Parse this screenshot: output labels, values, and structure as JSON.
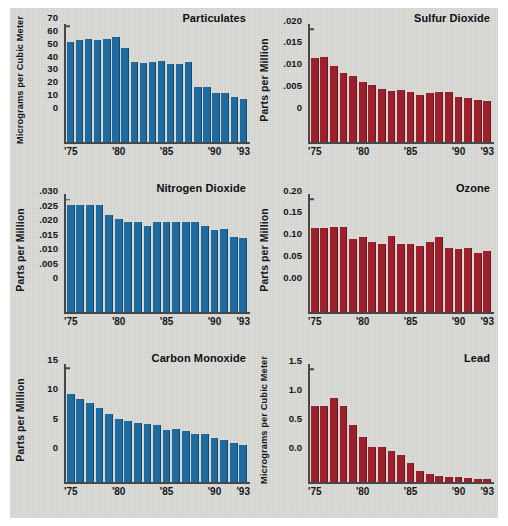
{
  "figure": {
    "background_color": "#d8d9d4",
    "blue": "#1f6a9e",
    "red": "#9c1f2c",
    "years": [
      "1975",
      "1976",
      "1977",
      "1978",
      "1979",
      "1980",
      "1981",
      "1982",
      "1983",
      "1984",
      "1985",
      "1986",
      "1987",
      "1988",
      "1989",
      "1990",
      "1991",
      "1992",
      "1993"
    ],
    "x_tick_labels": [
      "'75",
      "'80",
      "'85",
      "'90",
      "'93"
    ],
    "x_tick_years": [
      "1975",
      "1980",
      "1985",
      "1990",
      "1993"
    ]
  },
  "chart_data": [
    {
      "type": "bar",
      "title": "Particulates",
      "ylabel": "Micrograms per Cubic Meter",
      "xlabel": "",
      "color": "#1f6a9e",
      "ylim": [
        0,
        73
      ],
      "yticks": [
        0,
        10,
        20,
        30,
        40,
        50,
        60,
        70
      ],
      "ytick_labels": [
        "0",
        "10",
        "20",
        "30",
        "40",
        "50",
        "60",
        "70"
      ],
      "categories": [
        "'75",
        "'76",
        "'77",
        "'78",
        "'79",
        "'80",
        "'81",
        "'82",
        "'83",
        "'84",
        "'85",
        "'86",
        "'87",
        "'88",
        "'89",
        "'90",
        "'91",
        "'92",
        "'93"
      ],
      "values": [
        62,
        63,
        63.5,
        63,
        63.5,
        65,
        58,
        49.5,
        49,
        49.5,
        50.5,
        48.5,
        48.5,
        49.5,
        34,
        34,
        30.5,
        30.5,
        28,
        27
      ],
      "grid": false,
      "legend": "none"
    },
    {
      "type": "bar",
      "title": "Sulfur Dioxide",
      "ylabel": "Parts per Million",
      "xlabel": "",
      "color": "#9c1f2c",
      "ylim": [
        0,
        0.0215
      ],
      "yticks": [
        0,
        0.005,
        0.01,
        0.015,
        0.02
      ],
      "ytick_labels": [
        "0",
        ".005",
        ".010",
        ".015",
        ".020"
      ],
      "categories": [
        "'75",
        "'76",
        "'77",
        "'78",
        "'79",
        "'80",
        "'81",
        "'82",
        "'83",
        "'84",
        "'85",
        "'86",
        "'87",
        "'88",
        "'89",
        "'90",
        "'91",
        "'92",
        "'93"
      ],
      "values": [
        0.0153,
        0.0155,
        0.0139,
        0.0126,
        0.0121,
        0.0109,
        0.0105,
        0.0097,
        0.0094,
        0.0096,
        0.0091,
        0.0087,
        0.009,
        0.0092,
        0.0092,
        0.0082,
        0.008,
        0.0077,
        0.0076
      ],
      "grid": false,
      "legend": "none"
    },
    {
      "type": "bar",
      "title": "Nitrogen Dioxide",
      "ylabel": "Parts per Million",
      "xlabel": "",
      "color": "#1f6a9e",
      "ylim": [
        0,
        0.0325
      ],
      "yticks": [
        0,
        0.005,
        0.01,
        0.015,
        0.02,
        0.025,
        0.03
      ],
      "ytick_labels": [
        "0",
        ".005",
        ".010",
        ".015",
        ".020",
        ".025",
        ".030"
      ],
      "categories": [
        "'75",
        "'76",
        "'77",
        "'78",
        "'79",
        "'80",
        "'81",
        "'82",
        "'83",
        "'84",
        "'85",
        "'86",
        "'87",
        "'88",
        "'89",
        "'90",
        "'91",
        "'92",
        "'93"
      ],
      "values": [
        0.0295,
        0.0295,
        0.0295,
        0.0295,
        0.0267,
        0.0256,
        0.0247,
        0.0248,
        0.0236,
        0.0247,
        0.0247,
        0.0247,
        0.0248,
        0.0248,
        0.0238,
        0.0227,
        0.0228,
        0.0206,
        0.0203
      ],
      "grid": false,
      "legend": "none"
    },
    {
      "type": "bar",
      "title": "Ozone",
      "ylabel": "Parts per Million",
      "xlabel": "",
      "color": "#9c1f2c",
      "ylim": [
        0,
        0.215
      ],
      "yticks": [
        0,
        0.05,
        0.1,
        0.15,
        0.2
      ],
      "ytick_labels": [
        "0.00",
        "0.05",
        "0.10",
        "0.15",
        "0.20"
      ],
      "categories": [
        "'75",
        "'76",
        "'77",
        "'78",
        "'79",
        "'80",
        "'81",
        "'82",
        "'83",
        "'84",
        "'85",
        "'86",
        "'87",
        "'88",
        "'89",
        "'90",
        "'91",
        "'92",
        "'93"
      ],
      "values": [
        0.153,
        0.153,
        0.155,
        0.156,
        0.134,
        0.137,
        0.128,
        0.125,
        0.138,
        0.125,
        0.124,
        0.12,
        0.127,
        0.137,
        0.117,
        0.116,
        0.117,
        0.108,
        0.112
      ],
      "grid": false,
      "legend": "none"
    },
    {
      "type": "bar",
      "title": "Carbon Monoxide",
      "ylabel": "Parts per Million",
      "xlabel": "",
      "color": "#1f6a9e",
      "ylim": [
        0,
        16
      ],
      "yticks": [
        0,
        5,
        10,
        15
      ],
      "ytick_labels": [
        "0",
        "5",
        "10",
        "15"
      ],
      "categories": [
        "'75",
        "'76",
        "'77",
        "'78",
        "'79",
        "'80",
        "'81",
        "'82",
        "'83",
        "'84",
        "'85",
        "'86",
        "'87",
        "'88",
        "'89",
        "'90",
        "'91",
        "'92",
        "'93"
      ],
      "values": [
        11.9,
        11.3,
        10.7,
        10.1,
        9.2,
        8.6,
        8.3,
        8.0,
        7.9,
        7.8,
        7.1,
        7.2,
        6.9,
        6.6,
        6.5,
        6.0,
        5.7,
        5.3,
        5.1
      ],
      "grid": false,
      "legend": "none"
    },
    {
      "type": "bar",
      "title": "Lead",
      "ylabel": "Micrograms per Cubic Meter",
      "xlabel": "",
      "color": "#9c1f2c",
      "ylim": [
        0,
        1.62
      ],
      "yticks": [
        0,
        0.5,
        1.0,
        1.5
      ],
      "ytick_labels": [
        "0.0",
        "0.5",
        "1.0",
        "1.5"
      ],
      "categories": [
        "'75",
        "'76",
        "'77",
        "'78",
        "'79",
        "'80",
        "'81",
        "'82",
        "'83",
        "'84",
        "'85",
        "'86",
        "'87",
        "'88",
        "'89",
        "'90",
        "'91",
        "'92",
        "'93"
      ],
      "values": [
        1.04,
        1.05,
        1.16,
        1.04,
        0.78,
        0.62,
        0.48,
        0.48,
        0.43,
        0.38,
        0.27,
        0.16,
        0.11,
        0.09,
        0.08,
        0.07,
        0.06,
        0.05,
        0.05
      ],
      "grid": false,
      "legend": "none"
    }
  ]
}
